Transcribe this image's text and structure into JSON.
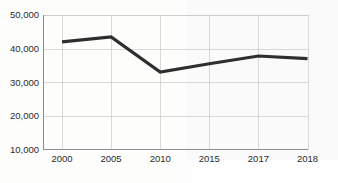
{
  "chart_data": {
    "type": "line",
    "title": "",
    "subtitle": "",
    "xlabel": "",
    "ylabel": "",
    "categories": [
      "2000",
      "2005",
      "2010",
      "2015",
      "2017",
      "2018"
    ],
    "values": [
      42000,
      43500,
      33000,
      35500,
      37800,
      37000
    ],
    "series": [
      {
        "name": "",
        "values": [
          42000,
          43500,
          33000,
          35500,
          37800,
          37000
        ]
      }
    ],
    "ylim": [
      10000,
      50000
    ],
    "yticks": [
      10000,
      20000,
      30000,
      40000,
      50000
    ],
    "ytick_labels": [
      "10,000",
      "20,000",
      "30,000",
      "40,000",
      "50,000"
    ],
    "xtick_labels": [
      "2000",
      "2005",
      "2010",
      "2015",
      "2017",
      "2018"
    ],
    "grid": true,
    "legend": false,
    "legend_position": "none",
    "line_color": "#2e2e2e",
    "grid_color": "#c9c9cc",
    "axis_color": "#8d8d92",
    "text_color": "#2b2b2b",
    "background_color": "#ffffff",
    "annotations": []
  },
  "axis": {
    "y": {
      "ticks": [
        {
          "label": "50,000",
          "value": 50000
        },
        {
          "label": "40,000",
          "value": 40000
        },
        {
          "label": "30,000",
          "value": 30000
        },
        {
          "label": "20,000",
          "value": 20000
        },
        {
          "label": "10,000",
          "value": 10000
        }
      ]
    },
    "x": {
      "ticks": [
        {
          "label": "2000",
          "value": 2000
        },
        {
          "label": "2005",
          "value": 2005
        },
        {
          "label": "2010",
          "value": 2010
        },
        {
          "label": "2015",
          "value": 2015
        },
        {
          "label": "2017",
          "value": 2017
        },
        {
          "label": "2018",
          "value": 2018
        }
      ]
    }
  }
}
